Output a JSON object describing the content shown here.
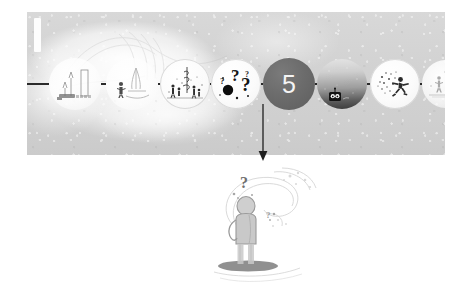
{
  "page": {
    "background_color": "#ffffff"
  },
  "banner": {
    "background_color": "#d2d2d2",
    "accent_bar": "white-vertical-bar",
    "backdrop_art": "pale-wave-illustration"
  },
  "timeline": {
    "connector_color": "#2a2a2a",
    "active_step": "5",
    "active_step_fill": "#6c6c6c",
    "active_step_text_color": "#f4f4f4",
    "nodes": [
      {
        "id": 1,
        "label": "",
        "style": "ghost",
        "icon": "city-harbor-icon",
        "cx": 48,
        "r": 26
      },
      {
        "id": 2,
        "label": "",
        "style": "ghost",
        "icon": "person-sailboat-icon",
        "cx": 105,
        "r": 26
      },
      {
        "id": 3,
        "label": "",
        "style": "pale",
        "icon": "figures-tower-icon",
        "cx": 158,
        "r": 25
      },
      {
        "id": 4,
        "label": "",
        "style": "pale",
        "icon": "question-marks-icon",
        "cx": 209,
        "r": 25
      },
      {
        "id": 5,
        "label": "5",
        "style": "dark",
        "icon": "number-badge-icon",
        "cx": 262,
        "r": 26
      },
      {
        "id": 6,
        "label": "",
        "style": "photo",
        "icon": "robot-face-icon",
        "cx": 315,
        "r": 25
      },
      {
        "id": 7,
        "label": "",
        "style": "pale",
        "icon": "running-person-icon",
        "cx": 368,
        "r": 25
      },
      {
        "id": 8,
        "label": "",
        "style": "ghost",
        "icon": "two-figures-icon",
        "cx": 419,
        "r": 24
      }
    ]
  },
  "arrow": {
    "name": "down-arrow",
    "color": "#1f1f1f",
    "points_from": "5",
    "points_to": "detail-illustration"
  },
  "detail": {
    "caption": "",
    "icon": "thinking-person-icon",
    "thought": "?",
    "description_art": "person-standing-with-question-mark"
  }
}
